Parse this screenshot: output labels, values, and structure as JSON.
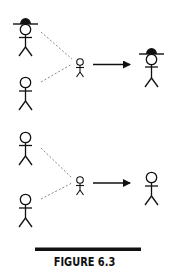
{
  "figure": {
    "caption": "FIGURE 6.3",
    "colors": {
      "stroke": "#111111",
      "dashed": "#888888",
      "background": "#ffffff"
    }
  },
  "panels": [
    {
      "id": "top-panel",
      "parents": [
        {
          "name": "parent-with-hat",
          "hat": true
        },
        {
          "name": "parent-without-hat",
          "hat": false
        }
      ],
      "offspring": {
        "name": "child",
        "hat": false
      },
      "result": {
        "name": "adult-with-hat",
        "hat": true
      }
    },
    {
      "id": "bottom-panel",
      "parents": [
        {
          "name": "parent-without-hat",
          "hat": false
        },
        {
          "name": "parent-without-hat",
          "hat": false
        }
      ],
      "offspring": {
        "name": "child",
        "hat": false
      },
      "result": {
        "name": "adult-without-hat",
        "hat": false
      }
    }
  ]
}
